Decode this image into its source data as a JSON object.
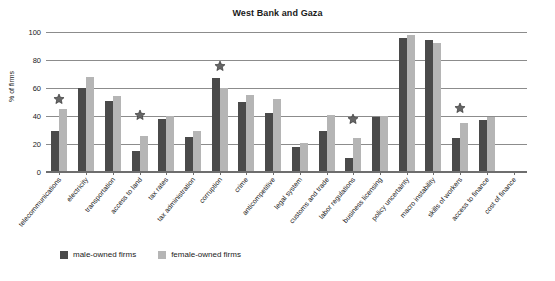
{
  "chart_data": {
    "type": "bar",
    "title": "West Bank and Gaza",
    "xlabel": "",
    "ylabel": "% of firms",
    "ylim": [
      0,
      100
    ],
    "yticks": [
      0,
      20,
      40,
      60,
      80,
      100
    ],
    "grid": true,
    "legend_position": "bottom-left",
    "categories": [
      "telecommunications",
      "electricity",
      "transportation",
      "access to land",
      "tax rates",
      "tax administration",
      "corruption",
      "crime",
      "anticompetitive",
      "legal system",
      "customs and trade",
      "labor regulations",
      "business licensing",
      "policy uncertainty",
      "macro instability",
      "skills of workers",
      "access to finance",
      "cost of finance"
    ],
    "series": [
      {
        "name": "male-owned firms",
        "color": "#4a4a4a",
        "values": [
          29,
          60,
          51,
          15,
          38,
          25,
          67,
          50,
          42,
          18,
          29,
          10,
          39,
          96,
          94,
          24,
          37,
          0
        ]
      },
      {
        "name": "female-owned firms",
        "color": "#b5b5b5",
        "values": [
          45,
          68,
          54,
          26,
          40,
          29,
          60,
          55,
          52,
          21,
          41,
          24,
          40,
          98,
          92,
          35,
          39,
          0
        ]
      }
    ],
    "annotations": {
      "marker": "star",
      "marker_color": "#5a5a5a",
      "points": [
        {
          "category": "telecommunications",
          "value": 52
        },
        {
          "category": "access to land",
          "value": 41
        },
        {
          "category": "corruption",
          "value": 76
        },
        {
          "category": "labor regulations",
          "value": 38
        },
        {
          "category": "skills of workers",
          "value": 46
        }
      ]
    }
  },
  "legend": {
    "items": [
      {
        "label": "male-owned firms",
        "key": "male"
      },
      {
        "label": "female-owned firms",
        "key": "female"
      }
    ]
  }
}
